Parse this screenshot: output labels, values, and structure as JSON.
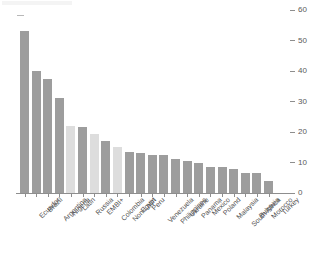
{
  "chart_data": {
    "type": "bar",
    "title": "",
    "subtitle": "",
    "xlabel": "",
    "ylabel": "",
    "ylim": [
      0,
      60
    ],
    "yticks": [
      0,
      10,
      20,
      30,
      40,
      50,
      60
    ],
    "ytick_labels": [
      "0",
      "10",
      "20",
      "30",
      "40",
      "50",
      "60"
    ],
    "y_axis_position": "right",
    "grid": false,
    "legend": "none",
    "categories": [
      "Ecuador",
      "Brazil",
      "Argentina",
      "Nigeria",
      "Latin",
      "Russia",
      "EMBI+",
      "Colombia",
      "Non-Latin",
      "Egypt",
      "Peru",
      "Venezuela",
      "Philippines",
      "Ukraine",
      "Panama",
      "Mexico",
      "Poland",
      "Malaysia",
      "South Africa",
      "Bulgaria",
      "Morocco",
      "Turkey"
    ],
    "values": [
      53,
      40,
      37.5,
      31,
      22,
      21.5,
      19.5,
      17,
      15,
      13.5,
      13,
      12.5,
      12.5,
      11,
      10.5,
      10,
      8.5,
      8.5,
      8,
      6.5,
      6.5,
      4
    ],
    "bar_kinds": [
      "country",
      "country",
      "country",
      "country",
      "aggregate",
      "country",
      "aggregate",
      "country",
      "aggregate",
      "country",
      "country",
      "country",
      "country",
      "country",
      "country",
      "country",
      "country",
      "country",
      "country",
      "country",
      "country",
      "country"
    ]
  },
  "colors": {
    "bar_country": "#9d9d9d",
    "bar_aggregate": "#dddddd",
    "axis": "#8e8e8e",
    "text": "#4f4f4f",
    "background": "#ffffff"
  }
}
